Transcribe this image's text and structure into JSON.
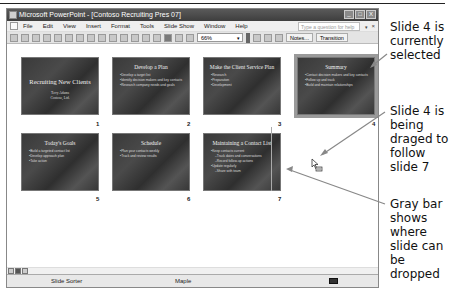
{
  "window": {
    "title": "Microsoft PowerPoint - [Contoso Recruiting Pres 07]",
    "buttons": [
      "_",
      "□",
      "X"
    ]
  },
  "menubar": {
    "items": [
      "File",
      "Edit",
      "View",
      "Insert",
      "Format",
      "Tools",
      "Slide Show",
      "Window",
      "Help"
    ],
    "help_placeholder": "Type a question for help",
    "help_dropdown": "▾",
    "doc_close": "×"
  },
  "toolbar": {
    "zoom": "66%",
    "zoom_dropdown": "▾",
    "notes_label": "Notes...",
    "transition_label": "Transition"
  },
  "slides": [
    {
      "number": "1",
      "title": "Recruiting New Clients",
      "subtitle": [
        "Terry Adams",
        "Contoso, Ltd."
      ],
      "bullets": []
    },
    {
      "number": "2",
      "title": "Develop a Plan",
      "bullets": [
        "Develop a target list",
        "Identify decision makers and key contacts",
        "Research company needs and goals"
      ]
    },
    {
      "number": "3",
      "title": "Make the Client Service Plan",
      "bullets": [
        "Research",
        "Preparation",
        "Development"
      ]
    },
    {
      "number": "4",
      "title": "Summary",
      "bullets": [
        "Contact decision makers and key contacts",
        "Follow up and track",
        "Build and maintain relationships"
      ],
      "selected": true
    },
    {
      "number": "5",
      "title": "Today's Goals",
      "bullets": [
        "Build a targeted contact list",
        "Develop approach plan",
        "Take action"
      ]
    },
    {
      "number": "6",
      "title": "Schedule",
      "bullets": [
        "Plan your contacts weekly",
        "Track and review results"
      ]
    },
    {
      "number": "7",
      "title": "Maintaining a Contact List",
      "bullets": [
        "Keep contacts current",
        "Track dates and conversations",
        "Record follow-up actions",
        "Update regularly",
        "Share with team"
      ]
    }
  ],
  "statusbar": {
    "view": "Slide Sorter",
    "design": "Maple"
  },
  "callouts": {
    "selected": "Slide 4 is currently selected",
    "dragged": "Slide 4 is being draged to follow slide 7",
    "graybar": "Gray bar shows where slide can be dropped"
  },
  "colors": {
    "slide_bg": "#3a3a3a",
    "selection_outline": "#9a9a9a",
    "title_bar": "#4a4a4a",
    "drop_bar": "#aaaaaa"
  }
}
